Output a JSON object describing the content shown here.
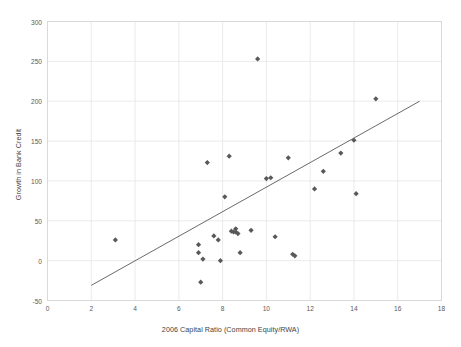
{
  "chart_data": {
    "type": "scatter",
    "title": "",
    "xlabel": "2006 Capital Ratio (Common Equity/RWA)",
    "ylabel": "Growth in Bank Credit",
    "xlim": [
      0,
      18
    ],
    "ylim": [
      -50,
      300
    ],
    "xticks": [
      0,
      2,
      4,
      6,
      8,
      10,
      12,
      14,
      16,
      18
    ],
    "yticks": [
      -50,
      0,
      50,
      100,
      150,
      200,
      250,
      300
    ],
    "xtick_labels": [
      "0",
      "2",
      "4",
      "6",
      "8",
      "10",
      "12",
      "14",
      "16",
      "18"
    ],
    "ytick_labels": [
      "-50",
      "0",
      "50",
      "100",
      "150",
      "200",
      "250",
      "300"
    ],
    "grid": true,
    "legend": false,
    "marker": "diamond",
    "marker_color": "#595959",
    "series": [
      {
        "name": "Banks",
        "points": [
          [
            3.1,
            26
          ],
          [
            6.9,
            20
          ],
          [
            6.9,
            10
          ],
          [
            7.0,
            -27
          ],
          [
            7.1,
            2
          ],
          [
            7.3,
            123
          ],
          [
            7.6,
            31
          ],
          [
            7.8,
            26
          ],
          [
            7.9,
            0
          ],
          [
            8.1,
            80
          ],
          [
            8.3,
            131
          ],
          [
            8.4,
            37
          ],
          [
            8.5,
            36
          ],
          [
            8.6,
            40
          ],
          [
            8.6,
            36
          ],
          [
            8.7,
            34
          ],
          [
            8.8,
            10
          ],
          [
            9.3,
            38
          ],
          [
            9.6,
            253
          ],
          [
            10.0,
            103
          ],
          [
            10.2,
            104
          ],
          [
            10.4,
            30
          ],
          [
            11.0,
            129
          ],
          [
            11.2,
            8
          ],
          [
            11.3,
            6
          ],
          [
            12.2,
            90
          ],
          [
            12.6,
            112
          ],
          [
            13.4,
            135
          ],
          [
            14.0,
            151
          ],
          [
            14.1,
            84
          ],
          [
            15.0,
            203
          ]
        ]
      }
    ],
    "trendline": {
      "type": "linear",
      "x_start": 2.0,
      "y_start": -31,
      "x_end": 17.0,
      "y_end": 200,
      "color": "#595959"
    }
  }
}
